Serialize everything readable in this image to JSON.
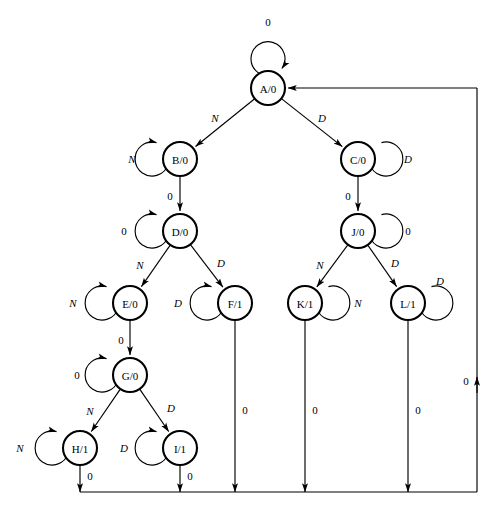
{
  "diagram": {
    "type": "finite-state-machine",
    "node_radius": 17,
    "loop_radius": 17,
    "colors": {
      "node_stroke": "#000000",
      "node_fill": "#ffffff",
      "edge_stroke": "#000000",
      "background": "#ffffff"
    },
    "nodes": [
      {
        "id": "A",
        "label": "A/0",
        "x": 268,
        "y": 88
      },
      {
        "id": "B",
        "label": "B/0",
        "x": 180,
        "y": 159
      },
      {
        "id": "C",
        "label": "C/0",
        "x": 358,
        "y": 159
      },
      {
        "id": "D",
        "label": "D/0",
        "x": 180,
        "y": 231
      },
      {
        "id": "J",
        "label": "J/0",
        "x": 358,
        "y": 231
      },
      {
        "id": "E",
        "label": "E/0",
        "x": 130,
        "y": 303
      },
      {
        "id": "F",
        "label": "F/1",
        "x": 235,
        "y": 303
      },
      {
        "id": "K",
        "label": "K/1",
        "x": 305,
        "y": 303
      },
      {
        "id": "L",
        "label": "L/1",
        "x": 408,
        "y": 303
      },
      {
        "id": "G",
        "label": "G/0",
        "x": 130,
        "y": 375
      },
      {
        "id": "H",
        "label": "H/1",
        "x": 80,
        "y": 448
      },
      {
        "id": "I",
        "label": "I/1",
        "x": 180,
        "y": 448
      }
    ],
    "self_loops": [
      {
        "node": "A",
        "label": "0",
        "side": "top",
        "label_x": 268,
        "label_y": 22
      },
      {
        "node": "B",
        "label": "N",
        "side": "left",
        "label_x": 132,
        "label_y": 159
      },
      {
        "node": "C",
        "label": "D",
        "side": "right",
        "label_x": 408,
        "label_y": 159
      },
      {
        "node": "D",
        "label": "0",
        "side": "left",
        "label_x": 124,
        "label_y": 231
      },
      {
        "node": "J",
        "label": "0",
        "side": "right",
        "label_x": 408,
        "label_y": 231
      },
      {
        "node": "E",
        "label": "N",
        "side": "left",
        "label_x": 73,
        "label_y": 303
      },
      {
        "node": "F",
        "label": "D",
        "side": "left",
        "label_x": 178,
        "label_y": 303
      },
      {
        "node": "K",
        "label": "N",
        "side": "right",
        "label_x": 358,
        "label_y": 303
      },
      {
        "node": "L",
        "label": "D",
        "side": "right",
        "label_x": 440,
        "label_y": 281
      },
      {
        "node": "G",
        "label": "0",
        "side": "left",
        "label_x": 77,
        "label_y": 375
      },
      {
        "node": "H",
        "label": "N",
        "side": "left",
        "label_x": 20,
        "label_y": 448
      },
      {
        "node": "I",
        "label": "D",
        "side": "left",
        "label_x": 124,
        "label_y": 448
      }
    ],
    "edges": [
      {
        "from": "A",
        "to": "B",
        "label": "N",
        "label_x": 215,
        "label_y": 118
      },
      {
        "from": "A",
        "to": "C",
        "label": "D",
        "label_x": 322,
        "label_y": 118
      },
      {
        "from": "B",
        "to": "D",
        "label": "0",
        "label_x": 170,
        "label_y": 196
      },
      {
        "from": "C",
        "to": "J",
        "label": "0",
        "label_x": 348,
        "label_y": 196
      },
      {
        "from": "D",
        "to": "E",
        "label": "N",
        "label_x": 140,
        "label_y": 265
      },
      {
        "from": "D",
        "to": "F",
        "label": "D",
        "label_x": 221,
        "label_y": 263
      },
      {
        "from": "J",
        "to": "K",
        "label": "N",
        "label_x": 320,
        "label_y": 265
      },
      {
        "from": "J",
        "to": "L",
        "label": "D",
        "label_x": 395,
        "label_y": 263
      },
      {
        "from": "E",
        "to": "G",
        "label": "0",
        "label_x": 121,
        "label_y": 340
      },
      {
        "from": "G",
        "to": "H",
        "label": "N",
        "label_x": 90,
        "label_y": 411
      },
      {
        "from": "G",
        "to": "I",
        "label": "D",
        "label_x": 171,
        "label_y": 408
      }
    ],
    "return_edges": [
      {
        "from": "H",
        "label": "0",
        "label_x": 90,
        "label_y": 476
      },
      {
        "from": "I",
        "label": "0",
        "label_x": 190,
        "label_y": 476
      },
      {
        "from": "F",
        "label": "0",
        "label_x": 245,
        "label_y": 410
      },
      {
        "from": "K",
        "label": "0",
        "label_x": 315,
        "label_y": 410
      },
      {
        "from": "L",
        "label": "0",
        "label_x": 418,
        "label_y": 410
      }
    ],
    "return_bus": {
      "bottom_y": 492,
      "right_x": 477,
      "top_y": 88,
      "target": "A",
      "label": "0",
      "label_x": 466,
      "label_y": 381
    }
  }
}
